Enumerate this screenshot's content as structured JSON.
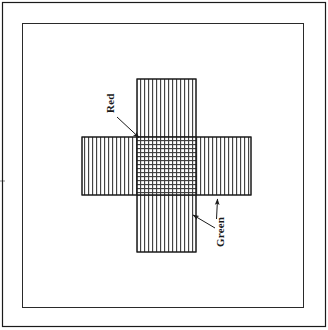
{
  "figure": {
    "type": "diagram",
    "background_color": "#ffffff",
    "stroke_color": "#1a1a1a",
    "hatch_color": "#3a3a3a",
    "outer_border": {
      "name": "outer-frame",
      "x": 2,
      "y": 2,
      "width": 324,
      "height": 325,
      "stroke_width": 1.2
    },
    "inner_border": {
      "name": "inner-frame",
      "x": 22,
      "y": 23,
      "width": 282,
      "height": 285,
      "stroke_width": 1.0
    },
    "shapes": [
      {
        "name": "vertical-bar",
        "orientation": "vertical",
        "hatch": "vertical-lines",
        "x": 137,
        "y": 79,
        "width": 59,
        "height": 173
      },
      {
        "name": "horizontal-bar",
        "orientation": "horizontal",
        "hatch": "vertical-lines",
        "x": 82,
        "y": 137,
        "width": 169,
        "height": 58
      },
      {
        "name": "overlap-region",
        "hatch": "cross-hatch",
        "x": 137,
        "y": 137,
        "width": 59,
        "height": 58
      }
    ],
    "hatch_spacing_px": 4,
    "callouts": [
      {
        "name": "callout-red",
        "label": "Red",
        "rotation_deg": -90,
        "text_x": 114,
        "text_y": 113,
        "arrows": [
          {
            "x1": 116,
            "y1": 116,
            "x2": 140,
            "y2": 138
          }
        ]
      },
      {
        "name": "callout-green",
        "label": "Green",
        "rotation_deg": -90,
        "text_x": 224,
        "text_y": 243,
        "arrows": [
          {
            "x1": 216,
            "y1": 218,
            "x2": 218,
            "y2": 198
          },
          {
            "x1": 215,
            "y1": 227,
            "x2": 192,
            "y2": 214
          }
        ]
      }
    ]
  }
}
